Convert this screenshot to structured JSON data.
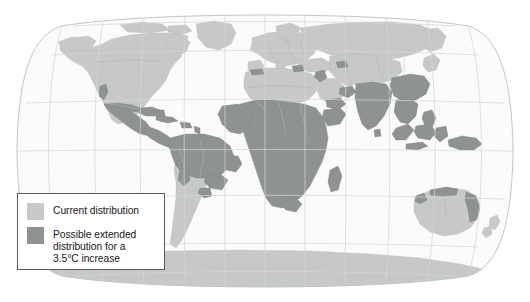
{
  "figure": {
    "kind": "world-distribution-map",
    "projection": "robinson"
  },
  "colors": {
    "ocean": "#fbfbfb",
    "map_outline": "#c2c6c8",
    "graticule": "#d2d6d8",
    "land_current": "#c7c9c7",
    "land_extended": "#8e9290",
    "country_border": "#b0b4b4",
    "legend_border": "#555b5e",
    "legend_text": "#16181a",
    "page_background": "#ffffff"
  },
  "legend": {
    "items": [
      {
        "swatch_color": "#c7c9c7",
        "label": "Current distribution",
        "key": "current-distribution"
      },
      {
        "swatch_color": "#8e9290",
        "label": "Possible extended\ndistribution for a\n3.5°C increase",
        "key": "extended-distribution"
      }
    ]
  },
  "map_regions": {
    "current_distribution": [
      "North America",
      "Europe",
      "North Africa",
      "Central Asia",
      "Southern South America",
      "Australia",
      "Antarctica",
      "Greenland"
    ],
    "possible_extended_distribution": [
      "Mexico and Central America",
      "Caribbean",
      "Southern United States fringe",
      "Northern South America / Amazon",
      "Sub-Saharan Africa",
      "Madagascar",
      "Arabian Peninsula fringe",
      "Indian subcontinent",
      "Southeast Asia",
      "Southern China",
      "Indonesia",
      "Papua New Guinea",
      "Northern and eastern Australia coast"
    ]
  }
}
